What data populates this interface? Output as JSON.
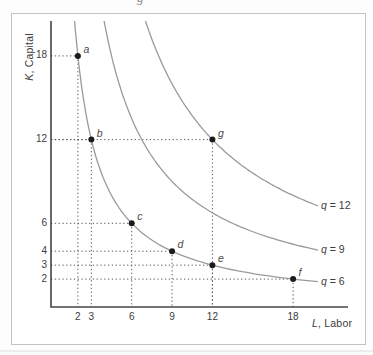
{
  "figure": {
    "cropped_text_fragment": "g",
    "border_color": "#c3c3c3",
    "background": "#ffffff"
  },
  "chart_data": {
    "type": "line",
    "subtype": "isoquant-curves",
    "title": "",
    "xlabel": "L, Labor",
    "ylabel": "K, Capital",
    "x_ticks": [
      2,
      3,
      6,
      9,
      12,
      18
    ],
    "y_ticks": [
      18,
      12,
      6,
      4,
      3,
      2
    ],
    "xlim": [
      0,
      22
    ],
    "ylim": [
      0,
      20.5
    ],
    "grid": "dotted guide lines from each axis to each labeled point",
    "legend_position": "labels at right end of each curve",
    "curves": [
      {
        "label": "q = 6",
        "q": 6,
        "points_on_curve": [
          "a",
          "b",
          "c",
          "d",
          "e",
          "f"
        ]
      },
      {
        "label": "q = 9",
        "q": 9,
        "points_on_curve": []
      },
      {
        "label": "q = 12",
        "q": 12,
        "points_on_curve": [
          "g"
        ]
      }
    ],
    "points": [
      {
        "label": "a",
        "L": 2,
        "K": 18
      },
      {
        "label": "b",
        "L": 3,
        "K": 12
      },
      {
        "label": "c",
        "L": 6,
        "K": 6
      },
      {
        "label": "d",
        "L": 9,
        "K": 4
      },
      {
        "label": "e",
        "L": 12,
        "K": 3
      },
      {
        "label": "f",
        "L": 18,
        "K": 2
      },
      {
        "label": "g",
        "L": 12,
        "K": 12
      }
    ],
    "colors": {
      "axis": "#454545",
      "curve": "#9a9a9a",
      "guide": "#575757",
      "point": "#1b1b1b",
      "text": "#3c3c3c",
      "frame": "#c3c3c3"
    }
  }
}
